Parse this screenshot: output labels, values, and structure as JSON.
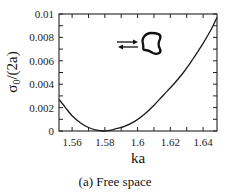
{
  "chart_data": {
    "type": "line",
    "title": "",
    "caption": "(a) Free space",
    "xlabel": "ka",
    "ylabel": "σ0/(2a)",
    "ylabel_main": "σ",
    "ylabel_sub": "0",
    "ylabel_rest": "/(2a)",
    "xlim": [
      1.552,
      1.6485
    ],
    "ylim": [
      0,
      0.01
    ],
    "xticks": [
      1.56,
      1.58,
      1.6,
      1.62,
      1.64
    ],
    "xtick_labels": [
      "1.56",
      "1.58",
      "1.6",
      "1.62",
      "1.64"
    ],
    "yticks": [
      0,
      0.002,
      0.004,
      0.006,
      0.008,
      0.01
    ],
    "ytick_labels": [
      "0",
      "0.002",
      "0.004",
      "0.006",
      "0.008",
      "0.01"
    ],
    "grid": false,
    "legend": null,
    "series": [
      {
        "name": "sigma0_over_2a",
        "color": "#1a1a1a",
        "x": [
          1.552,
          1.556,
          1.56,
          1.565,
          1.57,
          1.575,
          1.579,
          1.583,
          1.587,
          1.592,
          1.598,
          1.604,
          1.61,
          1.616,
          1.622,
          1.628,
          1.634,
          1.64,
          1.645,
          1.6485
        ],
        "y": [
          0.0027,
          0.002,
          0.0013,
          0.0007,
          0.0003,
          7e-05,
          0.0,
          5e-05,
          0.0002,
          0.0004,
          0.0008,
          0.0014,
          0.0022,
          0.0031,
          0.004,
          0.005,
          0.0062,
          0.0075,
          0.0087,
          0.0097
        ]
      }
    ],
    "inset": {
      "description": "incident and scattered arrows pointing at a rounded-triangle scatterer",
      "arrow_top": "→",
      "arrow_bottom": "←"
    }
  }
}
